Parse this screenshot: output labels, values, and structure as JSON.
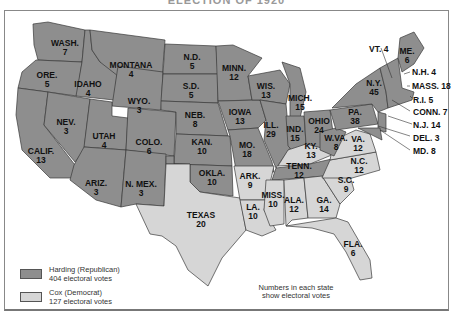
{
  "title": "ELECTION OF 1920",
  "colors": {
    "republican": "#8e8e8e",
    "democrat": "#d6d6d6",
    "border": "#3a3a3a"
  },
  "legend": {
    "republican": {
      "line1": "Harding (Republican)",
      "line2": "404 electoral votes"
    },
    "democrat": {
      "line1": "Cox (Democrat)",
      "line2": "127 electoral votes"
    }
  },
  "note": {
    "line1": "Numbers in each state",
    "line2": "show electoral votes"
  },
  "states": [
    {
      "abbr": "WASH.",
      "votes": "7",
      "party": "rep"
    },
    {
      "abbr": "ORE.",
      "votes": "5",
      "party": "rep"
    },
    {
      "abbr": "CALIF.",
      "votes": "13",
      "party": "rep"
    },
    {
      "abbr": "IDAHO",
      "votes": "4",
      "party": "rep"
    },
    {
      "abbr": "NEV.",
      "votes": "3",
      "party": "rep"
    },
    {
      "abbr": "MONTANA",
      "votes": "4",
      "party": "rep"
    },
    {
      "abbr": "WYO.",
      "votes": "3",
      "party": "rep"
    },
    {
      "abbr": "UTAH",
      "votes": "4",
      "party": "rep"
    },
    {
      "abbr": "ARIZ.",
      "votes": "3",
      "party": "rep"
    },
    {
      "abbr": "COLO.",
      "votes": "6",
      "party": "rep"
    },
    {
      "abbr": "N. MEX.",
      "votes": "3",
      "party": "rep"
    },
    {
      "abbr": "N.D.",
      "votes": "5",
      "party": "rep"
    },
    {
      "abbr": "S.D.",
      "votes": "5",
      "party": "rep"
    },
    {
      "abbr": "NEB.",
      "votes": "8",
      "party": "rep"
    },
    {
      "abbr": "KAN.",
      "votes": "10",
      "party": "rep"
    },
    {
      "abbr": "OKLA.",
      "votes": "10",
      "party": "rep"
    },
    {
      "abbr": "TEXAS",
      "votes": "20",
      "party": "dem"
    },
    {
      "abbr": "MINN.",
      "votes": "12",
      "party": "rep"
    },
    {
      "abbr": "IOWA",
      "votes": "13",
      "party": "rep"
    },
    {
      "abbr": "MO.",
      "votes": "18",
      "party": "rep"
    },
    {
      "abbr": "ARK.",
      "votes": "9",
      "party": "dem"
    },
    {
      "abbr": "LA.",
      "votes": "10",
      "party": "dem"
    },
    {
      "abbr": "WIS.",
      "votes": "13",
      "party": "rep"
    },
    {
      "abbr": "ILL.",
      "votes": "29",
      "party": "rep"
    },
    {
      "abbr": "MICH.",
      "votes": "15",
      "party": "rep"
    },
    {
      "abbr": "IND.",
      "votes": "15",
      "party": "rep"
    },
    {
      "abbr": "OHIO",
      "votes": "24",
      "party": "rep"
    },
    {
      "abbr": "KY.",
      "votes": "13",
      "party": "dem"
    },
    {
      "abbr": "TENN.",
      "votes": "12",
      "party": "rep"
    },
    {
      "abbr": "MISS.",
      "votes": "10",
      "party": "dem"
    },
    {
      "abbr": "ALA.",
      "votes": "12",
      "party": "dem"
    },
    {
      "abbr": "GA.",
      "votes": "14",
      "party": "dem"
    },
    {
      "abbr": "FLA.",
      "votes": "6",
      "party": "dem"
    },
    {
      "abbr": "S.C.",
      "votes": "9",
      "party": "dem"
    },
    {
      "abbr": "N.C.",
      "votes": "12",
      "party": "dem"
    },
    {
      "abbr": "VA.",
      "votes": "12",
      "party": "dem"
    },
    {
      "abbr": "W.VA.",
      "votes": "8",
      "party": "rep"
    },
    {
      "abbr": "PA.",
      "votes": "38",
      "party": "rep"
    },
    {
      "abbr": "N.Y.",
      "votes": "45",
      "party": "rep"
    },
    {
      "abbr": "ME.",
      "votes": "6",
      "party": "rep"
    }
  ],
  "callouts": [
    {
      "text": "VT. 4"
    },
    {
      "text": "N.H. 4"
    },
    {
      "text": "MASS. 18"
    },
    {
      "text": "R.I. 5"
    },
    {
      "text": "CONN. 7"
    },
    {
      "text": "N.J. 14"
    },
    {
      "text": "DEL. 3"
    },
    {
      "text": "MD. 8"
    }
  ]
}
